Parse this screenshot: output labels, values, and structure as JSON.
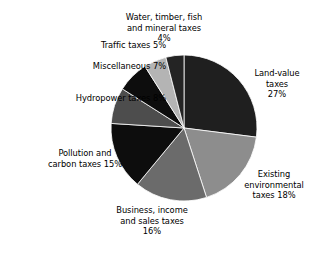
{
  "chart_data": {
    "type": "pie",
    "title": "",
    "subtitle": "",
    "xlabel": "",
    "ylabel": "",
    "legend_position": "none",
    "grid": false,
    "start_angle_deg": 0,
    "direction": "clockwise",
    "categories": [
      "Land-value taxes",
      "Existing environmental taxes",
      "Business, income and sales taxes",
      "Pollution and carbon taxes",
      "Hydropower taxes",
      "Miscellaneous",
      "Traffic taxes",
      "Water, timber, fish and mineral taxes"
    ],
    "values": [
      27,
      18,
      16,
      15,
      8,
      7,
      5,
      4
    ],
    "units": "percent",
    "slices": [
      {
        "name": "land-value-taxes",
        "label_lines": "Land-value\ntaxes\n27%",
        "value": 27,
        "value_text": "27%",
        "color": "#1f1f1f"
      },
      {
        "name": "existing-environmental-taxes",
        "label_lines": "Existing\nenvironmental\ntaxes 18%",
        "value": 18,
        "value_text": "18%",
        "color": "#8d8d8d"
      },
      {
        "name": "business-income-sales-taxes",
        "label_lines": "Business, income\nand sales taxes\n16%",
        "value": 16,
        "value_text": "16%",
        "color": "#6b6b6b"
      },
      {
        "name": "pollution-carbon-taxes",
        "label_lines": "Pollution and\ncarbon taxes 15%",
        "value": 15,
        "value_text": "15%",
        "color": "#0d0d0d"
      },
      {
        "name": "hydropower-taxes",
        "label_lines": "Hydropower taxes 8%",
        "value": 8,
        "value_text": "8%",
        "color": "#4d4d4d"
      },
      {
        "name": "miscellaneous",
        "label_lines": "Miscellaneous 7%",
        "value": 7,
        "value_text": "7%",
        "color": "#0d0d0d"
      },
      {
        "name": "traffic-taxes",
        "label_lines": "Traffic taxes 5%",
        "value": 5,
        "value_text": "5%",
        "color": "#b4b4b4"
      },
      {
        "name": "water-timber-fish-mineral-taxes",
        "label_lines": "Water, timber, fish\nand mineral taxes\n4%",
        "value": 4,
        "value_text": "4%",
        "color": "#242424"
      }
    ],
    "geometry": {
      "center_x": 184,
      "center_y": 128,
      "radius": 73
    },
    "background_color": "#ffffff",
    "text_color": "#000000"
  }
}
